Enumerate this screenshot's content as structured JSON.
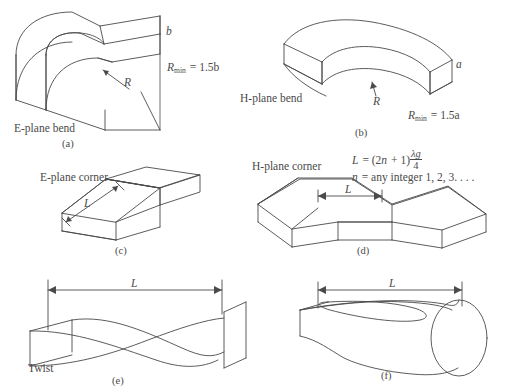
{
  "figure": {
    "stroke_color": "#4a4a4a",
    "background_color": "#ffffff",
    "panels": [
      {
        "id": "a",
        "panel_label": "(a)",
        "name": "E-plane bend",
        "dim_labels": [
          "b",
          "R"
        ],
        "formula": "R_min = 1.5b"
      },
      {
        "id": "b",
        "panel_label": "(b)",
        "name": "H-plane bend",
        "dim_labels": [
          "a",
          "R"
        ],
        "formula": "R_min = 1.5a"
      },
      {
        "id": "c",
        "panel_label": "(c)",
        "name": "E-plane corner",
        "dim_labels": [
          "L"
        ],
        "formula": ""
      },
      {
        "id": "d",
        "panel_label": "(d)",
        "name": "H-plane corner",
        "dim_labels": [
          "L"
        ],
        "formula": "L = (2n + 1) lambda_g / 4"
      },
      {
        "id": "e",
        "panel_label": "(e)",
        "name": "Twist",
        "dim_labels": [
          "L"
        ],
        "formula": ""
      },
      {
        "id": "f",
        "panel_label": "(f)",
        "name": "",
        "dim_labels": [
          "L"
        ],
        "formula": ""
      }
    ]
  },
  "labels": {
    "e_plane_bend": "E-plane bend",
    "h_plane_bend": "H-plane bend",
    "e_plane_corner": "E-plane corner",
    "h_plane_corner": "H-plane corner",
    "twist": "Twist",
    "panel_a": "(a)",
    "panel_b": "(b)",
    "panel_c": "(c)",
    "panel_d": "(d)",
    "panel_e": "(e)",
    "panel_f": "(f)",
    "var_b": "b",
    "var_a": "a",
    "var_R_a": "R",
    "var_R_b": "R",
    "var_L_c": "L",
    "var_L_d": "L",
    "var_L_e": "L",
    "var_L_f": "L",
    "rmin_sym": "R",
    "rmin_sub": "min",
    "rmin_eq_a": "= 1.5b",
    "rmin_eq_b": "= 1.5a",
    "formula_L": "L",
    "formula_eq": "= (2",
    "formula_n": "n",
    "formula_plus": "+ 1)",
    "formula_num": "λg",
    "formula_den": "4",
    "formula_n2": "n",
    "formula_integer": "= any integer 1, 2, 3. . . ."
  }
}
